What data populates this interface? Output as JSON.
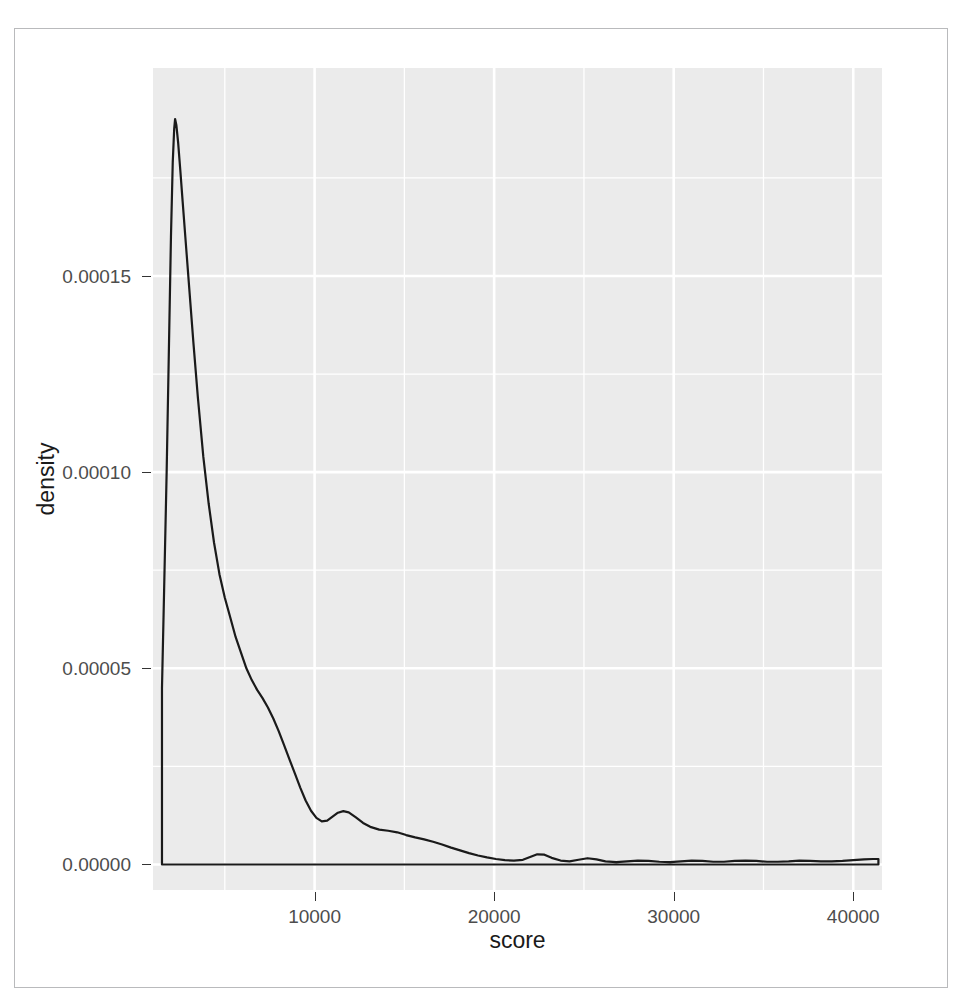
{
  "chart_data": {
    "type": "line",
    "title": "",
    "subtitle": "",
    "xlabel": "score",
    "ylabel": "density",
    "grid": true,
    "legend": null,
    "panel_background": "#ebebeb",
    "gridline_color": "#ffffff",
    "line_color": "#1a1a1a",
    "xlim": [
      1000,
      41600
    ],
    "ylim": [
      -6.5e-06,
      0.000203
    ],
    "xticks": [
      10000,
      20000,
      30000,
      40000
    ],
    "xtick_labels": [
      "10000",
      "20000",
      "30000",
      "40000"
    ],
    "yticks": [
      0.0,
      5e-05,
      0.0001,
      0.00015
    ],
    "ytick_labels": [
      "0.00000",
      "0.00005",
      "0.00010",
      "0.00015"
    ],
    "minor_xticks": [
      5000,
      15000,
      25000,
      35000
    ],
    "minor_yticks": [
      2.5e-05,
      7.5e-05,
      0.000125,
      0.000175
    ],
    "series": [
      {
        "name": "density",
        "x": [
          1500,
          1500,
          1620,
          1760,
          1880,
          2000,
          2100,
          2180,
          2230,
          2300,
          2400,
          2520,
          2650,
          2800,
          3000,
          3250,
          3500,
          3800,
          4100,
          4400,
          4700,
          5000,
          5300,
          5600,
          5900,
          6200,
          6500,
          6800,
          7100,
          7400,
          7700,
          8000,
          8300,
          8600,
          8900,
          9200,
          9500,
          9800,
          10100,
          10400,
          10700,
          11000,
          11300,
          11600,
          11900,
          12300,
          12700,
          13100,
          13600,
          14100,
          14600,
          15100,
          15600,
          16100,
          16600,
          17100,
          17600,
          18100,
          18600,
          19100,
          19600,
          20100,
          20600,
          21100,
          21600,
          22000,
          22400,
          22800,
          23200,
          23700,
          24200,
          24700,
          25200,
          25700,
          26200,
          26800,
          27400,
          28000,
          28600,
          29200,
          29800,
          30400,
          31000,
          31600,
          32200,
          32800,
          33400,
          34000,
          34600,
          35200,
          35800,
          36400,
          37000,
          37600,
          38200,
          38800,
          39400,
          40000,
          40600,
          41100,
          41400,
          41400
        ],
        "y": [
          0.0,
          4.49e-05,
          7e-05,
          0.0001,
          0.00013,
          0.00016,
          0.000179,
          0.0001875,
          0.00019,
          0.0001885,
          0.000184,
          0.000177,
          0.000169,
          0.00016,
          0.000148,
          0.000133,
          0.000119,
          0.000104,
          9.2e-05,
          8.2e-05,
          7.4e-05,
          6.8e-05,
          6.3e-05,
          5.8e-05,
          5.4e-05,
          5e-05,
          4.7e-05,
          4.45e-05,
          4.24e-05,
          4e-05,
          3.72e-05,
          3.4e-05,
          3.04e-05,
          2.68e-05,
          2.32e-05,
          1.96e-05,
          1.63e-05,
          1.37e-05,
          1.19e-05,
          1.1e-05,
          1.12e-05,
          1.22e-05,
          1.32e-05,
          1.36e-05,
          1.33e-05,
          1.2e-05,
          1.06e-05,
          9.6e-06,
          8.9e-06,
          8.6e-06,
          8.2e-06,
          7.5e-06,
          6.9e-06,
          6.4e-06,
          5.8e-06,
          5.1e-06,
          4.3e-06,
          3.6e-06,
          2.9e-06,
          2.3e-06,
          1.8e-06,
          1.4e-06,
          1.1e-06,
          1e-06,
          1.2e-06,
          1.9e-06,
          2.6e-06,
          2.5e-06,
          1.7e-06,
          1e-06,
          8e-07,
          1.2e-06,
          1.6e-06,
          1.3e-06,
          8e-07,
          6e-07,
          8e-07,
          1e-06,
          9e-07,
          7e-07,
          6e-07,
          8e-07,
          1e-06,
          9e-07,
          7e-07,
          7e-07,
          9e-07,
          1e-06,
          9e-07,
          7e-07,
          7e-07,
          8e-07,
          1e-06,
          9e-07,
          8e-07,
          8e-07,
          9e-07,
          1.1e-06,
          1.3e-06,
          1.4e-06,
          1.4e-06,
          0.0
        ]
      }
    ],
    "baseline_y": 0.0,
    "baseline_x_range": [
      1500,
      41400
    ],
    "peak": {
      "x": 2230,
      "y": 0.00019
    }
  },
  "axes": {
    "x": {
      "title": "score",
      "ticks": [
        {
          "value": 10000,
          "label": "10000"
        },
        {
          "value": 20000,
          "label": "20000"
        },
        {
          "value": 30000,
          "label": "30000"
        },
        {
          "value": 40000,
          "label": "40000"
        }
      ]
    },
    "y": {
      "title": "density",
      "ticks": [
        {
          "value": 0.0,
          "label": "0.00000"
        },
        {
          "value": 5e-05,
          "label": "0.00005"
        },
        {
          "value": 0.0001,
          "label": "0.00010"
        },
        {
          "value": 0.00015,
          "label": "0.00015"
        }
      ]
    }
  }
}
